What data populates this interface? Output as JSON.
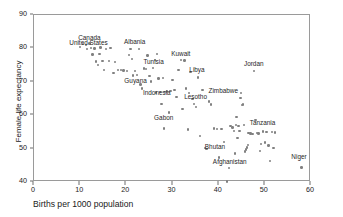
{
  "chart_data": {
    "type": "scatter",
    "title": "",
    "xlabel": "Births per 1000 population",
    "ylabel": "Female life expectancy",
    "xlim": [
      0,
      60
    ],
    "ylim": [
      40,
      90
    ],
    "xticks": [
      0,
      10,
      20,
      30,
      40,
      50,
      60
    ],
    "yticks": [
      40,
      50,
      60,
      70,
      80,
      90
    ],
    "grid": false,
    "legend": false,
    "marker": "dot-gray",
    "marker_color": "#808080",
    "frame_color": "#9a9a9a",
    "points": [
      [
        10.0,
        80.5
      ],
      [
        10.6,
        81.3
      ],
      [
        11.3,
        81.0
      ],
      [
        11.5,
        79.8
      ],
      [
        12.0,
        81.5
      ],
      [
        12.4,
        80.2
      ],
      [
        12.7,
        78.2
      ],
      [
        13.1,
        80.0
      ],
      [
        13.4,
        76.1
      ],
      [
        13.9,
        75.1
      ],
      [
        14.2,
        78.4
      ],
      [
        14.4,
        80.3
      ],
      [
        14.8,
        76.2
      ],
      [
        15.1,
        73.6
      ],
      [
        15.6,
        79.9
      ],
      [
        16.2,
        76.3
      ],
      [
        16.6,
        80.1
      ],
      [
        17.2,
        72.6
      ],
      [
        17.6,
        76.0
      ],
      [
        18.2,
        73.6
      ],
      [
        18.8,
        73.5
      ],
      [
        19.4,
        73.4
      ],
      [
        20.1,
        73.3
      ],
      [
        20.6,
        78.1
      ],
      [
        20.9,
        79.9
      ],
      [
        21.2,
        76.9
      ],
      [
        21.5,
        71.9
      ],
      [
        21.9,
        73.2
      ],
      [
        22.3,
        72.0
      ],
      [
        22.7,
        79.9
      ],
      [
        23.1,
        69.2
      ],
      [
        23.4,
        68.0
      ],
      [
        23.8,
        74.0
      ],
      [
        24.2,
        73.9
      ],
      [
        24.6,
        77.9
      ],
      [
        25.0,
        71.8
      ],
      [
        25.4,
        70.1
      ],
      [
        25.8,
        74.1
      ],
      [
        26.2,
        76.6
      ],
      [
        26.4,
        66.8
      ],
      [
        26.7,
        78.4
      ],
      [
        27.0,
        71.0
      ],
      [
        27.3,
        67.0
      ],
      [
        27.6,
        63.3
      ],
      [
        27.9,
        71.2
      ],
      [
        28.1,
        56.0
      ],
      [
        28.4,
        66.9
      ],
      [
        28.8,
        67.1
      ],
      [
        29.2,
        60.8
      ],
      [
        29.6,
        67.2
      ],
      [
        30.0,
        70.5
      ],
      [
        30.4,
        67.6
      ],
      [
        30.9,
        65.4
      ],
      [
        31.3,
        73.6
      ],
      [
        31.8,
        76.5
      ],
      [
        32.2,
        61.8
      ],
      [
        32.6,
        76.4
      ],
      [
        32.9,
        68.0
      ],
      [
        33.3,
        55.7
      ],
      [
        33.6,
        66.6
      ],
      [
        33.9,
        72.9
      ],
      [
        34.3,
        64.9
      ],
      [
        34.7,
        63.4
      ],
      [
        35.1,
        62.4
      ],
      [
        35.5,
        71.3
      ],
      [
        36.0,
        53.8
      ],
      [
        36.5,
        67.6
      ],
      [
        37.0,
        50.2
      ],
      [
        37.4,
        49.9
      ],
      [
        37.9,
        64.1
      ],
      [
        38.4,
        63.2
      ],
      [
        39.0,
        56.0
      ],
      [
        39.6,
        55.9
      ],
      [
        40.1,
        47.3
      ],
      [
        40.6,
        55.8
      ],
      [
        41.1,
        52.0
      ],
      [
        41.8,
        40.2
      ],
      [
        42.2,
        44.2
      ],
      [
        42.6,
        56.8
      ],
      [
        43.0,
        56.3
      ],
      [
        43.3,
        55.2
      ],
      [
        43.5,
        48.5
      ],
      [
        43.7,
        57.0
      ],
      [
        43.9,
        59.5
      ],
      [
        44.1,
        53.2
      ],
      [
        44.3,
        56.7
      ],
      [
        44.5,
        55.3
      ],
      [
        44.7,
        65.1
      ],
      [
        44.9,
        66.6
      ],
      [
        45.1,
        63.0
      ],
      [
        45.3,
        63.2
      ],
      [
        45.5,
        57.1
      ],
      [
        45.7,
        49.1
      ],
      [
        45.9,
        49.7
      ],
      [
        46.1,
        50.3
      ],
      [
        46.3,
        51.0
      ],
      [
        46.5,
        54.6
      ],
      [
        46.9,
        54.5
      ],
      [
        47.3,
        54.4
      ],
      [
        47.6,
        73.2
      ],
      [
        48.0,
        58.6
      ],
      [
        48.3,
        54.6
      ],
      [
        48.6,
        54.5
      ],
      [
        48.9,
        49.3
      ],
      [
        49.2,
        51.3
      ],
      [
        49.6,
        55.1
      ],
      [
        50.0,
        51.8
      ],
      [
        50.4,
        55.0
      ],
      [
        50.8,
        50.9
      ],
      [
        51.1,
        46.2
      ],
      [
        51.5,
        54.9
      ],
      [
        51.9,
        50.2
      ],
      [
        52.2,
        54.8
      ],
      [
        57.9,
        44.3
      ]
    ],
    "annotations": [
      {
        "label": "Canada",
        "x": 12.0,
        "y": 81.5,
        "dx": 0,
        "dy": -2.5
      },
      {
        "label": "United States",
        "x": 11.8,
        "y": 80.2,
        "dx": 0,
        "dy": -2.0
      },
      {
        "label": "Albania",
        "x": 21.8,
        "y": 80.3,
        "dx": 0,
        "dy": -2.0
      },
      {
        "label": "Kuwait",
        "x": 31.8,
        "y": 76.8,
        "dx": 0,
        "dy": -2.2
      },
      {
        "label": "Tunisia",
        "x": 25.9,
        "y": 74.5,
        "dx": 0,
        "dy": -2.0
      },
      {
        "label": "Jordan",
        "x": 47.6,
        "y": 73.8,
        "dx": 0,
        "dy": -2.2
      },
      {
        "label": "Libya",
        "x": 35.3,
        "y": 71.9,
        "dx": 0,
        "dy": -2.0
      },
      {
        "label": "Guyana",
        "x": 22.0,
        "y": 68.8,
        "dx": 0,
        "dy": -2.0
      },
      {
        "label": "Zimbabwe",
        "x": 41.0,
        "y": 65.7,
        "dx": 0,
        "dy": -2.0
      },
      {
        "label": "Indonesia",
        "x": 26.6,
        "y": 65.2,
        "dx": 0,
        "dy": -2.0
      },
      {
        "label": "Lesotho",
        "x": 35.0,
        "y": 64.0,
        "dx": 0,
        "dy": -2.0
      },
      {
        "label": "Tanzania",
        "x": 49.5,
        "y": 56.1,
        "dx": 0,
        "dy": -2.0
      },
      {
        "label": "Gabon",
        "x": 28.1,
        "y": 57.8,
        "dx": 0,
        "dy": -2.0
      },
      {
        "label": "Bhutan",
        "x": 39.2,
        "y": 49.0,
        "dx": 0,
        "dy": -2.0
      },
      {
        "label": "Niger",
        "x": 57.4,
        "y": 46.1,
        "dx": 0,
        "dy": -2.0
      },
      {
        "label": "Afghanistan",
        "x": 42.4,
        "y": 44.6,
        "dx": 0,
        "dy": -2.0
      }
    ]
  }
}
